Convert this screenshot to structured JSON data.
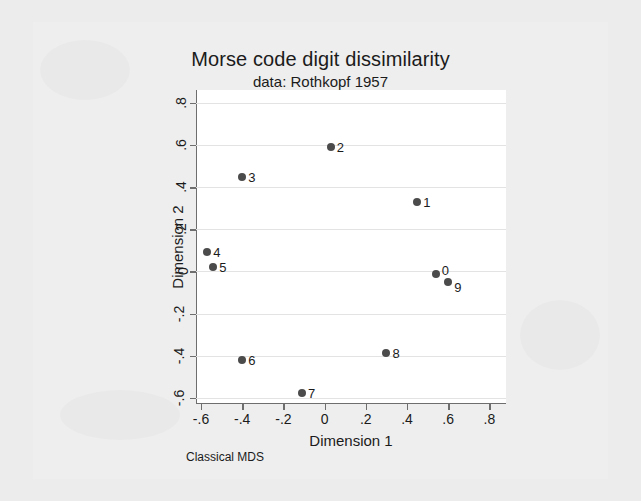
{
  "chart_data": {
    "type": "scatter",
    "title": "Morse code digit dissimilarity",
    "subtitle": "data: Rothkopf 1957",
    "xlabel": "Dimension 1",
    "ylabel": "Dimension 2",
    "note": "Classical MDS",
    "xlim": [
      -0.7,
      0.85
    ],
    "ylim": [
      -0.68,
      0.85
    ],
    "xticks": [
      -0.6,
      -0.4,
      -0.2,
      0,
      0.2,
      0.4,
      0.6,
      0.8
    ],
    "xticklabels": [
      "-.6",
      "-.4",
      "-.2",
      "0",
      ".2",
      ".4",
      ".6",
      ".8"
    ],
    "yticks": [
      -0.6,
      -0.4,
      -0.2,
      0,
      0.2,
      0.4,
      0.6,
      0.8
    ],
    "yticklabels": [
      "-.6",
      "-.4",
      "-.2",
      "0",
      ".2",
      ".4",
      ".6",
      ".8"
    ],
    "grid": "horizontal",
    "legend": "none",
    "marker_color": "#4b4b4b",
    "points": [
      {
        "label": "0",
        "x": 0.54,
        "y": -0.01,
        "label_pos": "right-up"
      },
      {
        "label": "1",
        "x": 0.45,
        "y": 0.33,
        "label_pos": "right"
      },
      {
        "label": "2",
        "x": 0.03,
        "y": 0.59,
        "label_pos": "right"
      },
      {
        "label": "3",
        "x": -0.4,
        "y": 0.45,
        "label_pos": "right"
      },
      {
        "label": "4",
        "x": -0.57,
        "y": 0.09,
        "label_pos": "right"
      },
      {
        "label": "5",
        "x": -0.54,
        "y": 0.02,
        "label_pos": "right"
      },
      {
        "label": "6",
        "x": -0.4,
        "y": -0.42,
        "label_pos": "right"
      },
      {
        "label": "7",
        "x": -0.11,
        "y": -0.58,
        "label_pos": "right"
      },
      {
        "label": "8",
        "x": 0.3,
        "y": -0.39,
        "label_pos": "right"
      },
      {
        "label": "9",
        "x": 0.6,
        "y": -0.05,
        "label_pos": "right-down"
      }
    ]
  }
}
